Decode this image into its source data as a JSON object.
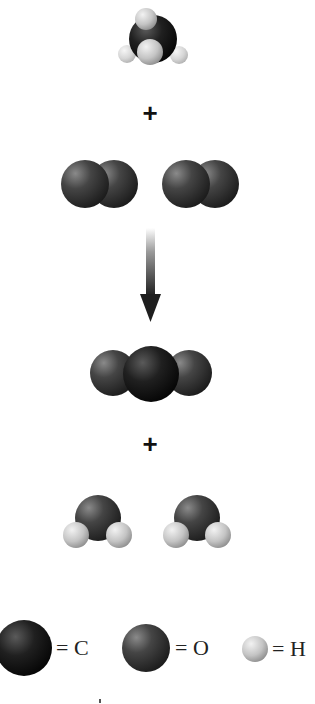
{
  "diagram": {
    "type": "chemical-reaction",
    "reactants": [
      {
        "name": "methane",
        "formula": "CH4",
        "count": 1
      },
      {
        "name": "oxygen",
        "formula": "O2",
        "count": 2
      }
    ],
    "products": [
      {
        "name": "carbon-dioxide",
        "formula": "CO2",
        "count": 1
      },
      {
        "name": "water",
        "formula": "H2O",
        "count": 2
      }
    ],
    "operators": {
      "plus_1": "+",
      "plus_2": "+"
    },
    "legend": [
      {
        "atom": "carbon",
        "label": "= C"
      },
      {
        "atom": "oxygen",
        "label": "= O"
      },
      {
        "atom": "hydrogen",
        "label": "= H"
      }
    ],
    "colors": {
      "carbon": "#141414",
      "oxygen": "#3a3a3a",
      "hydrogen": "#c8c8c8",
      "arrow": "#2a2a2a"
    }
  }
}
